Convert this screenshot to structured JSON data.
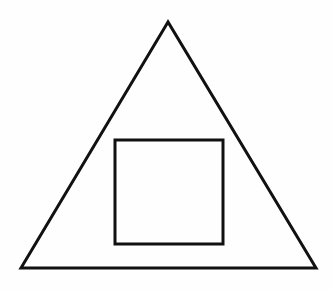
{
  "diagram": {
    "title": "Square inscribed in triangle",
    "background": "#fefefe",
    "stroke_color": "#111111",
    "shapes": [
      {
        "type": "triangle",
        "label": "outer-triangle",
        "points": [
          [
            168,
            22
          ],
          [
            21,
            268
          ],
          [
            316,
            268
          ]
        ],
        "stroke_width": 3
      },
      {
        "type": "square",
        "label": "inner-square",
        "x": 115,
        "y": 140,
        "width": 108,
        "height": 104,
        "stroke_width": 3
      }
    ]
  }
}
